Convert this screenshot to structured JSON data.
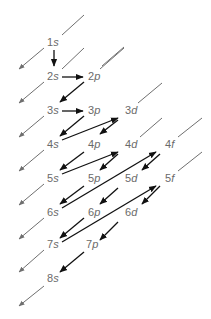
{
  "colors": {
    "label": "#6a6a6a",
    "guide": "#6f6f6f",
    "arrow": "#111111",
    "background": "#ffffff"
  },
  "orbitals": [
    {
      "n": "1",
      "l": "s",
      "x": 52,
      "y": 46
    },
    {
      "n": "2",
      "l": "s",
      "x": 52,
      "y": 80
    },
    {
      "n": "2",
      "l": "p",
      "x": 94,
      "y": 80
    },
    {
      "n": "3",
      "l": "s",
      "x": 52,
      "y": 114
    },
    {
      "n": "3",
      "l": "p",
      "x": 94,
      "y": 114
    },
    {
      "n": "3",
      "l": "d",
      "x": 132,
      "y": 114
    },
    {
      "n": "4",
      "l": "s",
      "x": 52,
      "y": 148
    },
    {
      "n": "4",
      "l": "p",
      "x": 94,
      "y": 148
    },
    {
      "n": "4",
      "l": "d",
      "x": 132,
      "y": 148
    },
    {
      "n": "4",
      "l": "f",
      "x": 170,
      "y": 148
    },
    {
      "n": "5",
      "l": "s",
      "x": 52,
      "y": 182
    },
    {
      "n": "5",
      "l": "p",
      "x": 94,
      "y": 182
    },
    {
      "n": "5",
      "l": "d",
      "x": 132,
      "y": 182
    },
    {
      "n": "5",
      "l": "f",
      "x": 170,
      "y": 182
    },
    {
      "n": "6",
      "l": "s",
      "x": 52,
      "y": 216
    },
    {
      "n": "6",
      "l": "p",
      "x": 94,
      "y": 216
    },
    {
      "n": "6",
      "l": "d",
      "x": 132,
      "y": 216
    },
    {
      "n": "7",
      "l": "s",
      "x": 52,
      "y": 248
    },
    {
      "n": "7",
      "l": "p",
      "x": 92,
      "y": 248
    },
    {
      "n": "8",
      "l": "s",
      "x": 52,
      "y": 282
    }
  ],
  "filling_order": [
    "1s",
    "2s",
    "2p",
    "3s",
    "3p",
    "4s",
    "3d",
    "4p",
    "5s",
    "4d",
    "5p",
    "6s",
    "4f",
    "5d",
    "6p",
    "7s",
    "5f",
    "6d",
    "7p",
    "8s"
  ]
}
